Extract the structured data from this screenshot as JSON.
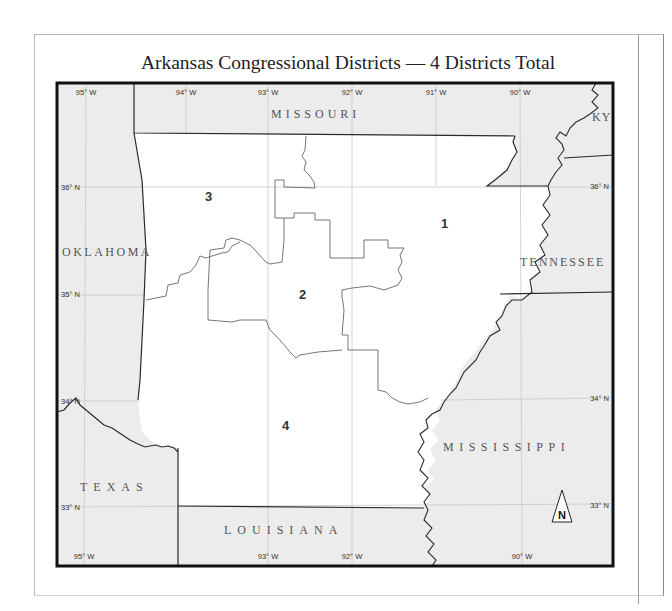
{
  "title": "Arkansas Congressional Districts — 4 Districts Total",
  "longitude_labels_top": [
    "95° W",
    "94° W",
    "93° W",
    "92° W",
    "91° W",
    "90° W"
  ],
  "longitude_labels_bottom": [
    "95° W",
    "93° W",
    "92° W",
    "90° W"
  ],
  "latitude_labels_left": [
    "36° N",
    "35° N",
    "34° N",
    "33° N"
  ],
  "latitude_labels_right": [
    "36° N",
    "34° N",
    "33° N"
  ],
  "states": {
    "missouri": "MISSOURI",
    "oklahoma": "OKLAHOMA",
    "texas": "TEXAS",
    "louisiana": "LOUISIANA",
    "mississippi": "MISSISSIPPI",
    "tennessee": "TENNESSEE",
    "kentucky": "KY"
  },
  "districts": [
    "1",
    "2",
    "3",
    "4"
  ],
  "north_arrow": "N",
  "colors": {
    "arkansas_fill": "#ffffff",
    "neighbor_fill": "#ececec",
    "border": "#111111"
  }
}
